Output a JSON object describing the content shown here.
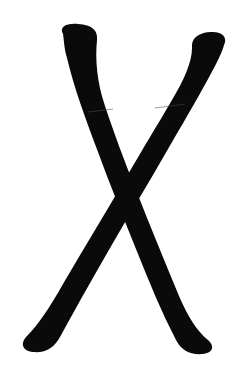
{
  "image": {
    "kind": "handwritten-glyph",
    "title": "Handwritten X Glyph",
    "description": "A thick hand-drawn letter X painted in solid black ink on a plain white background.",
    "alt_text": "Black brush-drawn letter X on white background",
    "width": 242,
    "height": 367,
    "background_color": "#ffffff",
    "ink_color": "#0a0a0a",
    "seam_color": "#4a4a4a",
    "character": "X"
  },
  "strokes": [
    {
      "id": "stroke-down-right",
      "name": "Top-left to bottom-right stroke",
      "order": 1,
      "start_point": {
        "x": 79,
        "y": 27
      },
      "end_point": {
        "x": 197,
        "y": 348
      },
      "path": "M 63 34 C 59 27 66 23 78 24 C 92 25 98 30 97 40 C 95 60 97 82 105 106 C 114 133 124 160 136 190 C 150 226 165 262 179 296 C 188 317 197 331 208 340 C 215 346 213 353 203 354 C 190 355 182 351 176 340 C 162 313 150 284 138 254 C 124 219 110 185 98 152 C 86 120 74 88 67 58 C 64 48 64 40 63 34 Z",
      "cap_start": "rounded-flat",
      "cap_end": "rounded-bulb",
      "width_top": 33,
      "width_middle": 30,
      "width_bottom": 34
    },
    {
      "id": "stroke-down-left",
      "name": "Top-right to bottom-left stroke",
      "order": 2,
      "start_point": {
        "x": 209,
        "y": 40
      },
      "end_point": {
        "x": 40,
        "y": 345
      },
      "path": "M 224 45 C 228 37 222 31 210 32 C 197 33 191 39 192 48 C 192 62 184 80 172 100 C 158 124 142 150 126 178 C 106 212 84 248 63 284 C 50 307 38 325 27 336 C 20 343 22 351 33 352 C 46 353 54 348 60 337 C 74 311 90 283 106 255 C 126 220 148 184 168 149 C 188 115 207 82 217 62 C 221 54 223 49 224 45 Z",
      "cap_start": "rounded-bulb",
      "cap_end": "rounded-bulb",
      "width_top": 33,
      "width_middle": 31,
      "width_bottom": 36
    }
  ],
  "crossing_point": {
    "x": 122,
    "y": 185
  },
  "seams": [
    {
      "id": "seam-left",
      "x1": 88,
      "y1": 112,
      "x2": 113,
      "y2": 109
    },
    {
      "id": "seam-right",
      "x1": 155,
      "y1": 108,
      "x2": 185,
      "y2": 104
    }
  ]
}
